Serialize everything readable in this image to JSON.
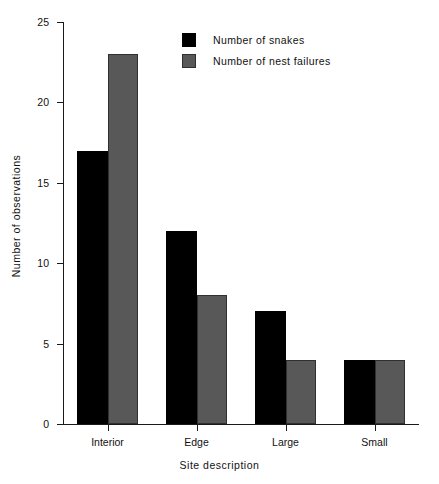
{
  "chart_data": {
    "type": "bar",
    "title": "",
    "subtitle": "",
    "xlabel": "Site  description",
    "ylabel": "Number  of  observations",
    "categories": [
      "Interior",
      "Edge",
      "Large",
      "Small"
    ],
    "series": [
      {
        "name": "Number of snakes",
        "color": "#000000",
        "values": [
          17,
          12,
          7,
          4
        ]
      },
      {
        "name": "Number of nest failures",
        "color": "#585858",
        "values": [
          23,
          8,
          4,
          4
        ]
      }
    ],
    "ylim": [
      0,
      25
    ],
    "yticks": [
      0,
      5,
      10,
      15,
      20,
      25
    ],
    "ytick_labels": [
      "0",
      "5",
      "10",
      "15",
      "20",
      "25"
    ],
    "grid": false,
    "legend_position": "top-center",
    "bar_style": "grouped-adjacent",
    "axis_color": "#1a1a1a",
    "background": "#ffffff"
  },
  "legend": {
    "entries": [
      {
        "label": "Number of snakes"
      },
      {
        "label": "Number of nest failures"
      }
    ]
  }
}
